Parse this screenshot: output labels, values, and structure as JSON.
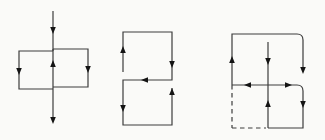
{
  "figure": {
    "width": 325,
    "height": 140,
    "background": "#fafaf8",
    "line_color": "#3d3d3d",
    "arrow_color": "#141414",
    "line_width": 1.2,
    "dash_pattern": "4.5,3.5",
    "arrow_size": {
      "length": 7,
      "half_width": 2.8
    }
  },
  "diagrams": [
    {
      "name": "left-diagram-two-adjacent-loops",
      "segments": [
        {
          "name": "entry-line",
          "d": "M53,11 L53,51"
        },
        {
          "name": "left-loop-edges",
          "d": "M53,51 L19,51 L19,89 L53,89"
        },
        {
          "name": "right-loop-edges",
          "d": "M53,49 L88,49 L88,87 L53,87"
        },
        {
          "name": "shared-middle-edge",
          "d": "M53,49 L53,89"
        },
        {
          "name": "exit-line",
          "d": "M53,89 L53,121"
        }
      ],
      "arrows": [
        {
          "name": "entry-flow",
          "dir": "down",
          "x": 53,
          "y": 34
        },
        {
          "name": "left-edge-flow",
          "dir": "down",
          "x": 19,
          "y": 75
        },
        {
          "name": "middle-edge-flow",
          "dir": "up",
          "x": 53,
          "y": 60
        },
        {
          "name": "right-edge-flow",
          "dir": "down",
          "x": 88,
          "y": 73
        },
        {
          "name": "exit-flow",
          "dir": "down",
          "x": 53,
          "y": 124
        }
      ]
    },
    {
      "name": "middle-diagram-serpentine-stacked-loops",
      "segments": [
        {
          "name": "serpentine-path",
          "d": "M123,72 L123,32 L172,32 L172,80 L123,80 L123,125 L172,125 L172,88"
        }
      ],
      "arrows": [
        {
          "name": "upper-left-flow",
          "dir": "up",
          "x": 123,
          "y": 46
        },
        {
          "name": "upper-right-flow",
          "dir": "down",
          "x": 172,
          "y": 68
        },
        {
          "name": "middle-crossbar-flow",
          "dir": "left",
          "x": 141,
          "y": 80
        },
        {
          "name": "lower-left-flow",
          "dir": "down",
          "x": 123,
          "y": 112
        },
        {
          "name": "lower-right-flow",
          "dir": "up",
          "x": 172,
          "y": 88
        }
      ]
    },
    {
      "name": "right-diagram-loops-with-dashed-square",
      "segments": [
        {
          "name": "outer-hook",
          "d": "M232,85 L232,34 L297,34 Q303,34 303,40 L303,70"
        },
        {
          "name": "center-upper-drop",
          "d": "M268,42 L268,85"
        },
        {
          "name": "middle-left-crossbar",
          "d": "M268,85 L232,85"
        },
        {
          "name": "center-lower-edge",
          "d": "M268,85 L268,128"
        },
        {
          "name": "lower-right-loop",
          "d": "M268,85 L297,85 Q303,85 303,91 L303,128 L268,128"
        },
        {
          "name": "dashed-left-edge",
          "d": "M232,85 L232,128",
          "dashed": true
        },
        {
          "name": "dashed-bottom-edge",
          "d": "M232,128 L266,128",
          "dashed": true
        }
      ],
      "arrows": [
        {
          "name": "outer-left-flow",
          "dir": "up",
          "x": 232,
          "y": 56
        },
        {
          "name": "outer-right-flow",
          "dir": "down",
          "x": 303,
          "y": 74
        },
        {
          "name": "center-upper-flow",
          "dir": "down",
          "x": 268,
          "y": 65
        },
        {
          "name": "middle-left-flow",
          "dir": "left",
          "x": 244,
          "y": 85
        },
        {
          "name": "middle-right-flow",
          "dir": "right",
          "x": 292,
          "y": 85
        },
        {
          "name": "center-lower-flow",
          "dir": "up",
          "x": 268,
          "y": 100
        },
        {
          "name": "square-right-flow",
          "dir": "down",
          "x": 303,
          "y": 108
        }
      ]
    }
  ]
}
